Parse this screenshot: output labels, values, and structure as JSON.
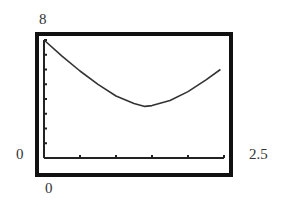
{
  "chart_data": {
    "type": "line",
    "title": "",
    "xlabel": "",
    "ylabel": "",
    "xlim": [
      0,
      2.5
    ],
    "ylim": [
      0,
      8
    ],
    "x_tick_step": 0.5,
    "y_tick_step": 1,
    "grid": false,
    "legend": null,
    "window_labels": {
      "ymax": "8",
      "ymin": "0",
      "xmin": "0",
      "xmax": "2.5"
    },
    "series": [
      {
        "name": "curve",
        "x": [
          0,
          0.25,
          0.5,
          0.75,
          1.0,
          1.25,
          1.4,
          1.5,
          1.75,
          2.0,
          2.25,
          2.45
        ],
        "y": [
          8.0,
          6.9,
          5.9,
          5.0,
          4.2,
          3.7,
          3.5,
          3.55,
          3.9,
          4.5,
          5.3,
          6.0
        ]
      }
    ],
    "color": "#333333"
  },
  "labels": {
    "ymax": "8",
    "ymin": "0",
    "xmin": "0",
    "xmax": "2.5"
  }
}
